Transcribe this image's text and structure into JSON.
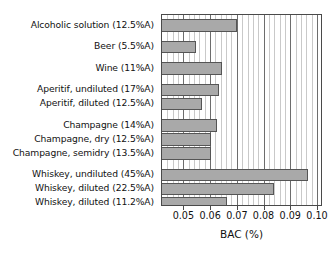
{
  "chart_data": {
    "type": "bar",
    "orientation": "horizontal",
    "title": "",
    "xlabel": "BAC (%)",
    "ylabel": "",
    "xlim": [
      0.042,
      0.1015
    ],
    "xticks": [
      0.05,
      0.06,
      0.07,
      0.08,
      0.09,
      0.1
    ],
    "xticklabels": [
      "0.05",
      "0.06",
      "0.07",
      "0.08",
      "0.09",
      "0.10"
    ],
    "grid": "vertical major solid, minor dotted",
    "legend": "none",
    "bar_color": "#a9a9a9",
    "bar_edge_color": "#555555",
    "categories": [
      "Alcoholic solution (12.5%A)",
      "Beer (5.5%A)",
      "Wine (11%A)",
      "Aperitif, undiluted (17%A)",
      "Aperitif, diluted (12.5%A)",
      "Champagne (14%A)",
      "Champagne, dry (12.5%A)",
      "Champagne, semidry (13.5%A)",
      "Whiskey, undiluted (45%A)",
      "Whiskey, diluted (22.5%A)",
      "Whiskey, diluted (11.2%A)"
    ],
    "values": [
      0.07,
      0.0548,
      0.0645,
      0.0635,
      0.0568,
      0.0625,
      0.0605,
      0.0605,
      0.0965,
      0.0838,
      0.0665
    ],
    "groups": [
      {
        "name": "Alcoholic solution",
        "indices": [
          0
        ]
      },
      {
        "name": "Beer",
        "indices": [
          1
        ]
      },
      {
        "name": "Wine",
        "indices": [
          2
        ]
      },
      {
        "name": "Aperitif",
        "indices": [
          3,
          4
        ]
      },
      {
        "name": "Champagne",
        "indices": [
          5,
          6,
          7
        ]
      },
      {
        "name": "Whiskey",
        "indices": [
          8,
          9,
          10
        ]
      }
    ]
  }
}
